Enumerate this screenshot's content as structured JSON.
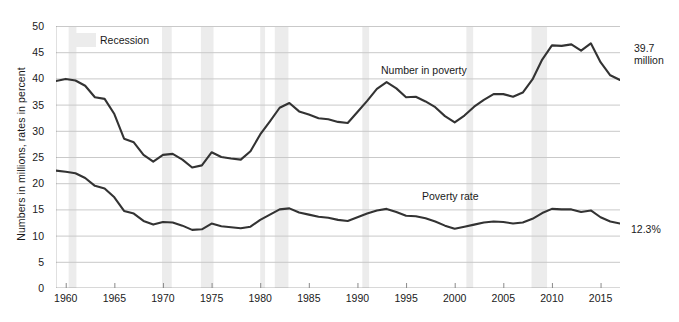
{
  "chart_data": {
    "type": "line",
    "title": "",
    "xlabel": "",
    "ylabel": "Numbers in millions, rates in percent",
    "xlim": [
      1959,
      2017
    ],
    "ylim": [
      0,
      50
    ],
    "grid": true,
    "legend_position": "inline",
    "y_ticks": [
      0,
      5,
      10,
      15,
      20,
      25,
      30,
      35,
      40,
      45,
      50
    ],
    "x_ticks": [
      1960,
      1965,
      1970,
      1975,
      1980,
      1985,
      1990,
      1995,
      2000,
      2005,
      2010,
      2015
    ],
    "x": [
      1959,
      1960,
      1961,
      1962,
      1963,
      1964,
      1965,
      1966,
      1967,
      1968,
      1969,
      1970,
      1971,
      1972,
      1973,
      1974,
      1975,
      1976,
      1977,
      1978,
      1979,
      1980,
      1981,
      1982,
      1983,
      1984,
      1985,
      1986,
      1987,
      1988,
      1989,
      1990,
      1991,
      1992,
      1993,
      1994,
      1995,
      1996,
      1997,
      1998,
      1999,
      2000,
      2001,
      2002,
      2003,
      2004,
      2005,
      2006,
      2007,
      2008,
      2009,
      2010,
      2011,
      2012,
      2013,
      2014,
      2015,
      2016,
      2017
    ],
    "series": [
      {
        "name": "Number in poverty",
        "units": "millions",
        "color": "#333333",
        "values": [
          39.5,
          39.9,
          39.6,
          38.6,
          36.4,
          36.1,
          33.2,
          28.5,
          27.8,
          25.4,
          24.1,
          25.4,
          25.6,
          24.5,
          23.0,
          23.4,
          25.9,
          25.0,
          24.7,
          24.5,
          26.1,
          29.3,
          31.8,
          34.4,
          35.3,
          33.7,
          33.1,
          32.4,
          32.2,
          31.7,
          31.5,
          33.6,
          35.7,
          38.0,
          39.3,
          38.1,
          36.4,
          36.5,
          35.6,
          34.5,
          32.8,
          31.6,
          32.9,
          34.6,
          35.9,
          37.0,
          37.0,
          36.5,
          37.3,
          39.8,
          43.6,
          46.3,
          46.2,
          46.5,
          45.3,
          46.7,
          43.1,
          40.6,
          39.7
        ]
      },
      {
        "name": "Poverty rate",
        "units": "percent",
        "color": "#333333",
        "values": [
          22.4,
          22.2,
          21.9,
          21.0,
          19.5,
          19.0,
          17.3,
          14.7,
          14.2,
          12.8,
          12.1,
          12.6,
          12.5,
          11.9,
          11.1,
          11.2,
          12.3,
          11.8,
          11.6,
          11.4,
          11.7,
          13.0,
          14.0,
          15.0,
          15.2,
          14.4,
          14.0,
          13.6,
          13.4,
          13.0,
          12.8,
          13.5,
          14.2,
          14.8,
          15.1,
          14.5,
          13.8,
          13.7,
          13.3,
          12.7,
          11.9,
          11.3,
          11.7,
          12.1,
          12.5,
          12.7,
          12.6,
          12.3,
          12.5,
          13.2,
          14.3,
          15.1,
          15.0,
          15.0,
          14.5,
          14.8,
          13.5,
          12.7,
          12.3
        ]
      }
    ],
    "recessions": [
      {
        "start": 1960.3,
        "end": 1961.1
      },
      {
        "start": 1969.9,
        "end": 1970.9
      },
      {
        "start": 1973.9,
        "end": 1975.2
      },
      {
        "start": 1980.0,
        "end": 1980.5
      },
      {
        "start": 1981.5,
        "end": 1982.9
      },
      {
        "start": 1990.5,
        "end": 1991.2
      },
      {
        "start": 2001.2,
        "end": 2001.9
      },
      {
        "start": 2007.9,
        "end": 2009.5
      }
    ],
    "recession_color": "#ececec",
    "gridline_color": "#c9c9c9",
    "axis_color": "#666666",
    "annotations": [
      {
        "name": "number-in-poverty-end-value",
        "text_line1": "39.7",
        "text_line2": "million"
      },
      {
        "name": "poverty-rate-end-value",
        "text_line1": "12.3%",
        "text_line2": ""
      }
    ],
    "inline_labels": [
      {
        "name": "number-in-poverty-label",
        "text": "Number in poverty"
      },
      {
        "name": "poverty-rate-label",
        "text": "Poverty rate"
      }
    ],
    "legend": {
      "recession_label": "Recession"
    }
  }
}
